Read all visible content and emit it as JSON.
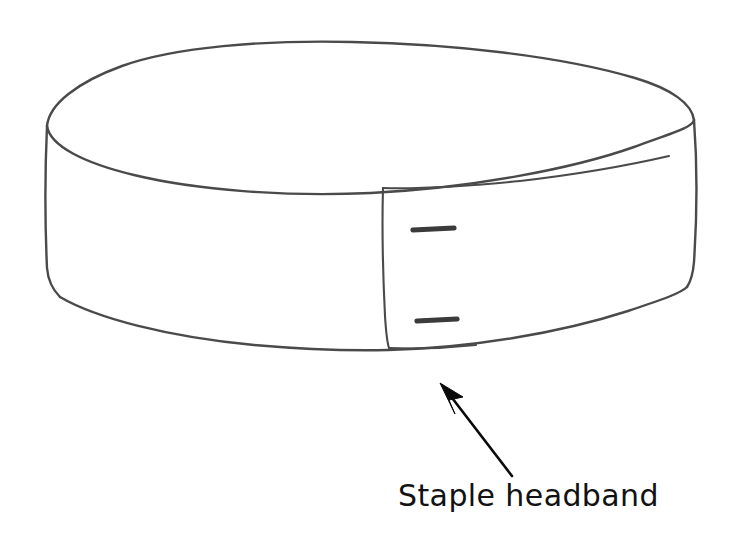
{
  "document": {
    "type": "hand-drawn instructional illustration",
    "background_color": "#ffffff",
    "ink_color": "#4a4a4a",
    "annotation_color": "#0a0a0a",
    "width": 731,
    "height": 546
  },
  "illustration": {
    "name": "headband-cylinder",
    "description": "Hand drawn short cylindrical headband seen in three-quarter view",
    "parts": {
      "top_rim": "top-ellipse",
      "band_wall": "cylinder-side-wall",
      "overlap_flap": "overlap-flap",
      "fasteners": "staple-marks"
    }
  },
  "staples": [
    {
      "label": "upper-staple"
    },
    {
      "label": "lower-staple"
    }
  ],
  "annotation": {
    "caption": "Staple headband",
    "pointer": "arrow-pointing-up-left",
    "target": "overlap-flap-bottom"
  }
}
